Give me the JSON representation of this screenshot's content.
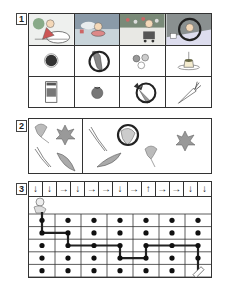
{
  "questions": [
    {
      "number": "1",
      "scenes": [
        {
          "name": "boy-sledding-dinosaur",
          "circled": false
        },
        {
          "name": "boy-in-inner-tube-pool",
          "circled": false
        },
        {
          "name": "boy-pushing-cart-flowers",
          "circled": false
        },
        {
          "name": "boy-at-snowy-house",
          "circled": true
        }
      ],
      "items_row2": [
        {
          "name": "ohagi-sweet",
          "circled": false
        },
        {
          "name": "corn",
          "circled": true
        },
        {
          "name": "dango-dumplings",
          "circled": false
        },
        {
          "name": "pudding-with-candle",
          "circled": false
        }
      ],
      "items_row3": [
        {
          "name": "milk-carton",
          "circled": false
        },
        {
          "name": "tomato",
          "circled": false
        },
        {
          "name": "carrot-with-leaves",
          "circled": true
        },
        {
          "name": "carrot",
          "circled": false
        }
      ]
    },
    {
      "number": "2",
      "reference_items": [
        "ginkgo-leaf",
        "maple-leaf",
        "pine-needles",
        "long-leaf"
      ],
      "answer_items": [
        {
          "name": "pine-needles",
          "circled": false
        },
        {
          "name": "long-leaf",
          "circled": false
        },
        {
          "name": "round-leaf",
          "circled": true
        },
        {
          "name": "ginkgo-leaf",
          "circled": false
        },
        {
          "name": "maple-leaf",
          "circled": false
        }
      ]
    },
    {
      "number": "3",
      "arrows": [
        "↓",
        "↓",
        "→",
        "↓",
        "→",
        "→",
        "↓",
        "→",
        "↑",
        "→",
        "→",
        "↓",
        "↓"
      ],
      "dot_grid": {
        "rows": 5,
        "cols": 7
      },
      "path": [
        [
          0,
          0
        ],
        [
          1,
          0
        ],
        [
          1,
          1
        ],
        [
          2,
          1
        ],
        [
          2,
          2
        ],
        [
          2,
          3
        ],
        [
          3,
          3
        ],
        [
          3,
          4
        ],
        [
          2,
          4
        ],
        [
          2,
          5
        ],
        [
          2,
          6
        ],
        [
          3,
          6
        ],
        [
          4,
          6
        ]
      ],
      "start_icon": "boy-character",
      "end_icon": "pencil-eraser"
    }
  ]
}
